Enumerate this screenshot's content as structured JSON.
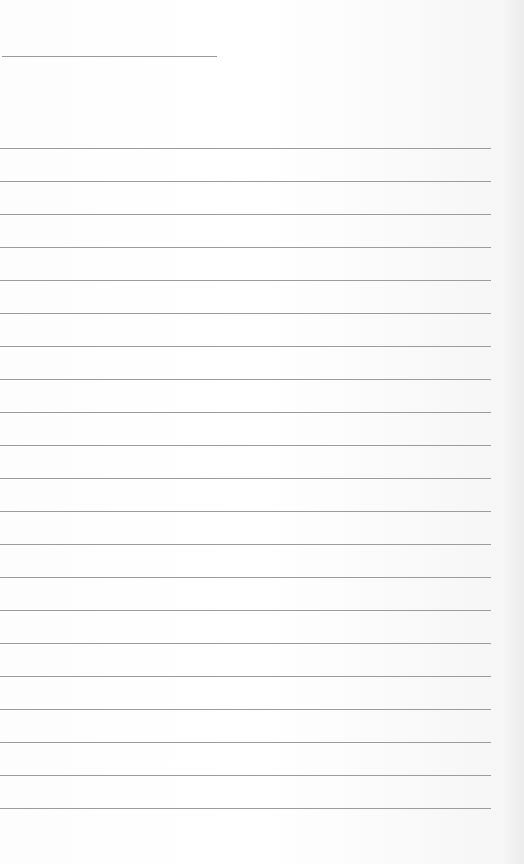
{
  "page": {
    "type": "ruled-notepad-page",
    "background_color": "#fbfbfb",
    "line_color": "#9c9c9c"
  },
  "title_line": {
    "x": 2,
    "y": 56,
    "width": 215
  },
  "ruled_lines": {
    "count": 21,
    "first_y": 148,
    "spacing": 33,
    "x": 0,
    "width": 491
  }
}
